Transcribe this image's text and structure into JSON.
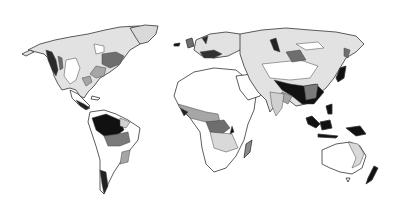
{
  "map": {
    "type": "world-choropleth-grayscale",
    "projection": "equirectangular-like",
    "labels": [],
    "legend": null,
    "palette": {
      "background": "#ffffff",
      "outline": "#333333",
      "class_0": "#ffffff",
      "class_1": "#d9d9d9",
      "class_2": "#a6a6a6",
      "class_3": "#6e6e6e",
      "class_4": "#111111"
    },
    "regions": [
      {
        "name": "north-america",
        "dominant_class": "class_1"
      },
      {
        "name": "greenland",
        "dominant_class": "class_1"
      },
      {
        "name": "central-america",
        "dominant_class": "class_4"
      },
      {
        "name": "south-america",
        "dominant_class": "class_0",
        "hotspot": "amazon",
        "hotspot_class": "class_4"
      },
      {
        "name": "europe",
        "dominant_class": "class_1"
      },
      {
        "name": "africa",
        "dominant_class": "class_0",
        "hotspot": "congo",
        "hotspot_class": "class_3"
      },
      {
        "name": "madagascar",
        "dominant_class": "class_2"
      },
      {
        "name": "asia",
        "dominant_class": "class_1",
        "hotspot": "south-east-asia",
        "hotspot_class": "class_4"
      },
      {
        "name": "indonesia",
        "dominant_class": "class_4"
      },
      {
        "name": "australia",
        "dominant_class": "class_0"
      },
      {
        "name": "new-zealand",
        "dominant_class": "class_4"
      }
    ]
  }
}
